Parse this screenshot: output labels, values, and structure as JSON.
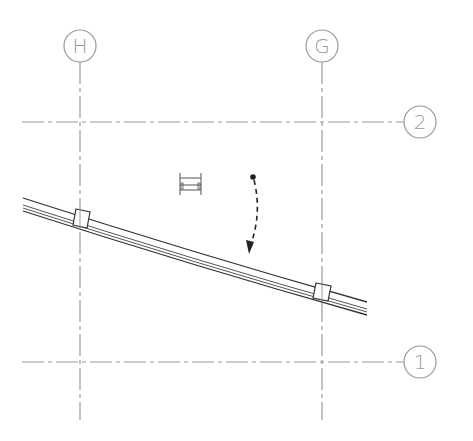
{
  "drawing": {
    "type": "structural framing plan",
    "gridlines": {
      "vertical": [
        {
          "label": "H",
          "x": 80
        },
        {
          "label": "G",
          "x": 322
        }
      ],
      "horizontal": [
        {
          "label": "2",
          "y": 122
        },
        {
          "label": "1",
          "y": 362
        }
      ]
    },
    "bubbles": {
      "h": "H",
      "g": "G",
      "two": "2",
      "one": "1"
    },
    "beam": {
      "description": "curved beam with two connection plates at gridlines H and G"
    },
    "symbols": {
      "section_mark": "beam section symbol",
      "span_arrow": "dashed span direction arrow"
    },
    "colors": {
      "gridline": "#9a9a9a",
      "beam": "#333333",
      "background": "#ffffff"
    }
  }
}
